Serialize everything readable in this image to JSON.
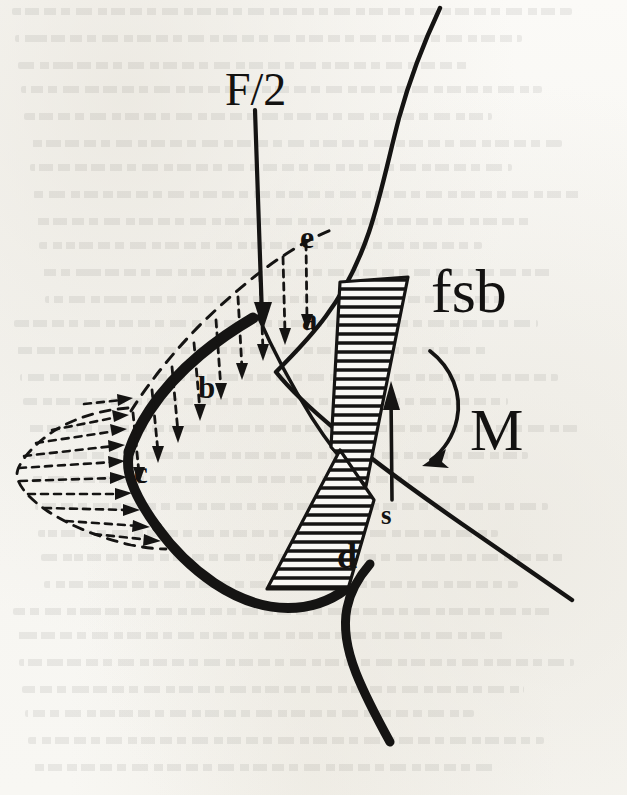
{
  "figure": {
    "kind": "scanned-engineering-diagram",
    "background_color": "#f7f6f2",
    "ink_color": "#151413",
    "labels": {
      "applied_force": "F/2",
      "point_a": "a",
      "point_b": "b",
      "point_c": "c",
      "point_d": "d",
      "point_e": "e",
      "section_line": "fsb",
      "moment": "M",
      "shear": "s"
    },
    "annotations": {
      "force_arrow": "vertical downward arrow labelled F/2",
      "moment_arrow": "clockwise curved arrow labelled M",
      "shear_arrow": "vertical upward arrow labelled s",
      "normal_pressure_arrows": "dashed vertical arrows onto upper surface between b and a",
      "leading_edge_arrows": "dashed horizontal arrows onto leading edge near c",
      "hatched_upper": "horizontally hatched wedge above crossing point",
      "hatched_lower": "horizontally hatched wedge below crossing point"
    },
    "chart_data": {
      "type": "line",
      "title": "",
      "xlabel": "",
      "ylabel": "",
      "grid": false,
      "legend": "none",
      "series": [
        {
          "name": "upper surface pressure distribution (dashed normal arrows, b to a)",
          "x": [
            0.05,
            0.15,
            0.25,
            0.35,
            0.45,
            0.55,
            0.65,
            0.75,
            0.85,
            0.95
          ],
          "values": [
            0.18,
            0.3,
            0.44,
            0.58,
            0.72,
            0.84,
            0.93,
            1.0,
            0.96,
            0.8
          ]
        },
        {
          "name": "leading edge pressure distribution (dashed tangential arrows near c)",
          "x": [
            0.0,
            0.12,
            0.25,
            0.4,
            0.55,
            0.7,
            0.85,
            1.0
          ],
          "values": [
            0.28,
            0.52,
            0.72,
            0.88,
            1.0,
            0.92,
            0.7,
            0.4
          ]
        },
        {
          "name": "hatched stress wedge above crossing (compression)",
          "x": [
            0.0,
            1.0
          ],
          "values": [
            1.0,
            0.0
          ]
        },
        {
          "name": "hatched stress wedge below crossing (tension)",
          "x": [
            0.0,
            1.0
          ],
          "values": [
            0.0,
            1.0
          ]
        }
      ]
    }
  }
}
